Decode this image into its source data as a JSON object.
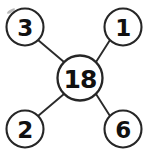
{
  "diagram": {
    "type": "node-link-cross",
    "background_color": "#ffffff",
    "stroke_color": "#262626",
    "line_color": "#2b2b2b",
    "text_color": "#111111",
    "center": {
      "id": "center",
      "label": "18",
      "cx": 80,
      "cy": 78,
      "r": 22.5,
      "stroke_width": 2.3,
      "role": "sum-node"
    },
    "nodes": [
      {
        "id": "top-left",
        "label": "3",
        "cx": 25,
        "cy": 27,
        "r": 18.5,
        "stroke_width": 2.1,
        "position": "top-left"
      },
      {
        "id": "top-right",
        "label": "1",
        "cx": 123,
        "cy": 27,
        "r": 18.5,
        "stroke_width": 2.1,
        "position": "top-right"
      },
      {
        "id": "bottom-left",
        "label": "2",
        "cx": 25,
        "cy": 129,
        "r": 18.5,
        "stroke_width": 2.1,
        "position": "bottom-left"
      },
      {
        "id": "bottom-right",
        "label": "6",
        "cx": 123,
        "cy": 129,
        "r": 18.5,
        "stroke_width": 2.1,
        "position": "bottom-right"
      }
    ],
    "edges": [
      {
        "id": "edge-top-left",
        "from": "top-left",
        "to": "center",
        "x1": 38,
        "y1": 40,
        "x2": 64,
        "y2": 62
      },
      {
        "id": "edge-top-right",
        "from": "top-right",
        "to": "center",
        "x1": 110,
        "y1": 40,
        "x2": 96,
        "y2": 62
      },
      {
        "id": "edge-bottom-left",
        "from": "bottom-left",
        "to": "center",
        "x1": 38,
        "y1": 116,
        "x2": 64,
        "y2": 94
      },
      {
        "id": "edge-bottom-right",
        "from": "bottom-right",
        "to": "center",
        "x1": 110,
        "y1": 116,
        "x2": 96,
        "y2": 94
      }
    ],
    "artifacts": [
      {
        "id": "speck-top-left",
        "cx": 11,
        "cy": 11,
        "rx": 4.5,
        "ry": 1.4,
        "rotate": -32
      }
    ]
  }
}
